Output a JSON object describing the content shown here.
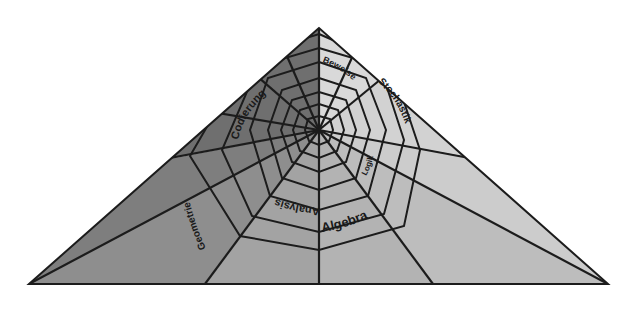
{
  "diagram": {
    "shape": "triangle",
    "apex": [
      319,
      28
    ],
    "base_left": [
      29,
      284
    ],
    "base_right": [
      608,
      284
    ],
    "web_center": [
      319,
      130
    ],
    "stroke_color": "#1c1c1c",
    "sectors": [
      {
        "name": "Beweise",
        "color": "#d9d9d9"
      },
      {
        "name": "Stochastik",
        "color": "#d2d2d2"
      },
      {
        "name": "Logik",
        "color": "#c6c6c6"
      },
      {
        "name": "Algebra",
        "color": "#b5b5b5"
      },
      {
        "name": "Analysis",
        "color": "#9e9e9e"
      },
      {
        "name": "Geometrie",
        "color": "#8a8a8a"
      },
      {
        "name": "Codierung",
        "color": "#6f6f6f"
      }
    ],
    "labels": {
      "beweise": "Beweise",
      "stochastik": "Stochastik",
      "logik": "Logik",
      "algebra": "Algebra",
      "analysis": "Analysis",
      "geometrie": "Geometrie",
      "codierung": "Codierung"
    }
  }
}
